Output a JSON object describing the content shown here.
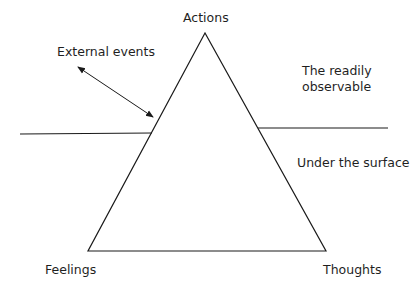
{
  "diagram": {
    "type": "iceberg-triangle",
    "vertices": {
      "top": "Actions",
      "bottom_left": "Feelings",
      "bottom_right": "Thoughts"
    },
    "external_label": "External events",
    "above_surface_line1": "The readily",
    "above_surface_line2": "observable",
    "below_surface": "Under the surface",
    "colors": {
      "stroke": "#1a1a1a",
      "text": "#1f1f1f",
      "background": "#ffffff"
    }
  }
}
